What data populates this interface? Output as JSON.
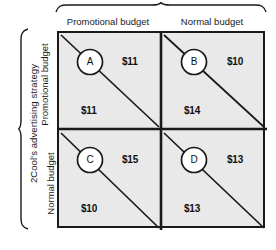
{
  "figure": {
    "type": "payoff-matrix",
    "row_group_label": "2Cool's advertising strategy",
    "column_headers": [
      "Promotional budget",
      "Normal budget"
    ],
    "row_headers": [
      "Promotional budget",
      "Normal budget"
    ],
    "cells": [
      {
        "id": "A",
        "row": "Promotional budget",
        "column": "Promotional budget",
        "upper_right_payoff": "$11",
        "lower_left_payoff": "$11"
      },
      {
        "id": "B",
        "row": "Promotional budget",
        "column": "Normal budget",
        "upper_right_payoff": "$10",
        "lower_left_payoff": "$14"
      },
      {
        "id": "C",
        "row": "Normal budget",
        "column": "Promotional budget",
        "upper_right_payoff": "$15",
        "lower_left_payoff": "$10"
      },
      {
        "id": "D",
        "row": "Normal budget",
        "column": "Normal budget",
        "upper_right_payoff": "$13",
        "lower_left_payoff": "$13"
      }
    ],
    "colors": {
      "cell_fill": "#e9e9e9",
      "line": "#1a1a1a",
      "circle_fill": "#ffffff",
      "text": "#111111",
      "page_background": "#ffffff"
    }
  }
}
